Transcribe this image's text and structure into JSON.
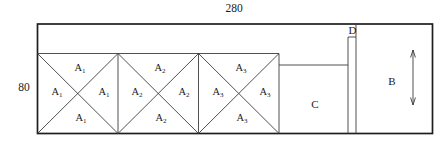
{
  "figure": {
    "dimension_labels": {
      "width": "280",
      "height": "80"
    },
    "square_labels": [
      {
        "base": "A",
        "sub": "1"
      },
      {
        "base": "A",
        "sub": "2"
      },
      {
        "base": "A",
        "sub": "3"
      }
    ],
    "region_labels": {
      "b": "B",
      "c": "C",
      "d": "D"
    },
    "icons": {
      "vertical_double_arrow": "↕"
    },
    "colors": {
      "bg": "#ffffff",
      "outer": "#1e1e1e",
      "line": "#3d3d3d",
      "text": "#1c1c1c"
    }
  }
}
